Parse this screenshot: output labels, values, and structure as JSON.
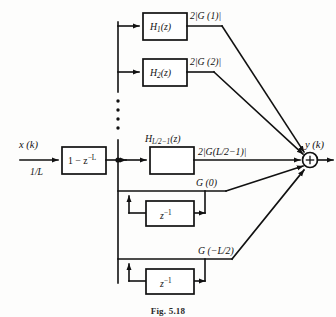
{
  "figure": {
    "caption": "Fig. 5.18",
    "input_signal": "x (k)",
    "input_gain": "1/L",
    "output_signal": "y (k)",
    "summing_node": "+"
  },
  "comb_filter": {
    "label_prefix": "1 − z",
    "label_exponent": "−L"
  },
  "branches": [
    {
      "block_prefix": "H",
      "block_sub": "1",
      "block_suffix": "(z)",
      "gain": "2|G (1)|"
    },
    {
      "block_prefix": "H",
      "block_sub": "2",
      "block_suffix": "(z)",
      "gain": "2|G (2)|"
    },
    {
      "block_prefix": "H",
      "block_sub": "L/2−1",
      "block_suffix": "(z)",
      "gain": "2|G(L/2−1)|"
    }
  ],
  "ellipsis": "⋮",
  "feedback_branches": [
    {
      "gain": "G (0)",
      "delay_prefix": "z",
      "delay_exponent": "−1"
    },
    {
      "gain": "G (−L/2)",
      "delay_prefix": "z",
      "delay_exponent": "−1"
    }
  ]
}
